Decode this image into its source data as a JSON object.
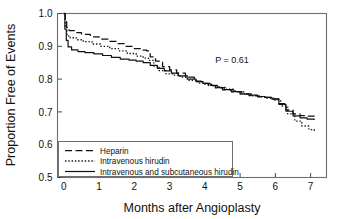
{
  "chart_data": {
    "type": "line",
    "title": "",
    "xlabel": "Months after Angioplasty",
    "ylabel": "Proportion Free of Events",
    "xlim": [
      -0.18,
      7.45
    ],
    "ylim": [
      0.5,
      1.0
    ],
    "xticks": [
      0,
      1,
      2,
      3,
      4,
      5,
      6,
      7
    ],
    "xtick_labels": [
      "0",
      "1",
      "2",
      "3",
      "4",
      "5",
      "6",
      "7"
    ],
    "yticks": [
      0.5,
      0.6,
      0.7,
      0.8,
      0.9,
      1.0
    ],
    "ytick_labels": [
      "0.5",
      "0.6",
      "0.7",
      "0.8",
      "0.9",
      "1.0"
    ],
    "grid": false,
    "legend_position": "lower-left",
    "annotations": [
      {
        "name": "p-value",
        "text": "P = 0.61",
        "x": 4.55,
        "y": 0.855
      }
    ],
    "series": [
      {
        "name": "Heparin",
        "style": "dashed",
        "color": "#111111",
        "x": [
          0.0,
          0.04,
          0.08,
          0.15,
          0.3,
          0.5,
          0.75,
          1.0,
          1.25,
          1.5,
          1.75,
          2.0,
          2.2,
          2.35,
          2.45,
          2.6,
          2.8,
          3.0,
          3.2,
          3.45,
          3.7,
          3.9,
          4.1,
          4.3,
          4.5,
          4.75,
          5.0,
          5.25,
          5.5,
          5.7,
          5.9,
          6.1,
          6.3,
          6.5,
          6.7,
          6.9,
          7.1
        ],
        "y": [
          1.0,
          0.975,
          0.955,
          0.948,
          0.942,
          0.936,
          0.929,
          0.922,
          0.915,
          0.908,
          0.9,
          0.893,
          0.888,
          0.886,
          0.868,
          0.855,
          0.838,
          0.828,
          0.818,
          0.806,
          0.794,
          0.787,
          0.78,
          0.773,
          0.767,
          0.761,
          0.754,
          0.75,
          0.746,
          0.744,
          0.74,
          0.725,
          0.706,
          0.694,
          0.689,
          0.687,
          0.686
        ]
      },
      {
        "name": "Intravenous hirudin",
        "style": "dotted",
        "color": "#111111",
        "x": [
          0.0,
          0.04,
          0.09,
          0.18,
          0.35,
          0.55,
          0.8,
          1.05,
          1.3,
          1.55,
          1.8,
          2.05,
          2.25,
          2.4,
          2.55,
          2.7,
          2.9,
          3.1,
          3.3,
          3.55,
          3.8,
          4.0,
          4.2,
          4.4,
          4.6,
          4.85,
          5.1,
          5.35,
          5.55,
          5.75,
          5.95,
          6.15,
          6.35,
          6.55,
          6.75,
          6.95,
          7.1
        ],
        "y": [
          1.0,
          0.96,
          0.932,
          0.926,
          0.92,
          0.914,
          0.907,
          0.9,
          0.893,
          0.886,
          0.878,
          0.87,
          0.864,
          0.857,
          0.84,
          0.826,
          0.816,
          0.812,
          0.806,
          0.796,
          0.788,
          0.784,
          0.78,
          0.775,
          0.769,
          0.762,
          0.754,
          0.749,
          0.745,
          0.742,
          0.736,
          0.718,
          0.694,
          0.672,
          0.657,
          0.646,
          0.64
        ]
      },
      {
        "name": "Intravenous and subcutaneous hirudin",
        "style": "solid",
        "color": "#111111",
        "x": [
          0.0,
          0.03,
          0.07,
          0.12,
          0.22,
          0.4,
          0.6,
          0.85,
          1.1,
          1.35,
          1.6,
          1.85,
          2.05,
          2.25,
          2.45,
          2.65,
          2.85,
          3.05,
          3.25,
          3.5,
          3.75,
          3.95,
          4.15,
          4.35,
          4.55,
          4.8,
          5.05,
          5.3,
          5.5,
          5.7,
          5.9,
          6.1,
          6.3,
          6.5,
          6.7,
          6.9,
          7.1
        ],
        "y": [
          1.0,
          0.952,
          0.918,
          0.898,
          0.889,
          0.884,
          0.881,
          0.877,
          0.872,
          0.866,
          0.861,
          0.858,
          0.855,
          0.85,
          0.842,
          0.833,
          0.825,
          0.818,
          0.81,
          0.8,
          0.792,
          0.787,
          0.781,
          0.774,
          0.768,
          0.762,
          0.755,
          0.751,
          0.747,
          0.744,
          0.739,
          0.723,
          0.702,
          0.688,
          0.682,
          0.678,
          0.675
        ]
      }
    ]
  },
  "legend": {
    "entries": [
      {
        "label": "Heparin",
        "style": "dashed"
      },
      {
        "label": "Intravenous hirudin",
        "style": "dotted"
      },
      {
        "label": "Intravenous and subcutaneous hirudin",
        "style": "solid"
      }
    ]
  },
  "colors": {
    "ink": "#111111",
    "frame": "#6f6f6f",
    "background": "#ffffff"
  }
}
